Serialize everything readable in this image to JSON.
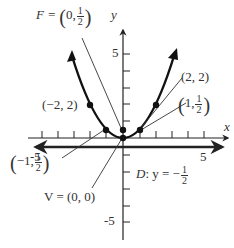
{
  "figure": {
    "axes": {
      "x_label": "x",
      "y_label": "y",
      "x_tick_labels": [
        "-5",
        "5"
      ],
      "y_tick_labels": [
        "5",
        "-5"
      ],
      "x_range": [
        -6,
        6
      ],
      "y_range": [
        -6,
        6
      ]
    },
    "labels": {
      "focus": {
        "prefix": "F = ",
        "open": "(",
        "x": "0,",
        "num": "1",
        "den": "2",
        "close": ")"
      },
      "vertex": "V = (0, 0)",
      "directrix": {
        "prefix": "D",
        "mid": ": y = −",
        "num": "1",
        "den": "2"
      },
      "point_neg2": "(−2, 2)",
      "point_2": "(2, 2)",
      "point_1": {
        "open": "(",
        "x": "1,",
        "num": "1",
        "den": "2",
        "close": ")"
      },
      "point_neg1": {
        "open": "(",
        "x": "−1,",
        "num": "1",
        "den": "2",
        "close": ")"
      }
    },
    "points": [
      {
        "name": "vertex",
        "x": 0,
        "y": 0
      },
      {
        "name": "focus",
        "x": 0,
        "y": 0.5
      },
      {
        "name": "p1",
        "x": 1,
        "y": 0.5
      },
      {
        "name": "pm1",
        "x": -1,
        "y": 0.5
      },
      {
        "name": "p2",
        "x": 2,
        "y": 2
      },
      {
        "name": "pm2",
        "x": -2,
        "y": 2
      }
    ],
    "equation": "x^2 = 2y",
    "colors": {
      "ink": "#222222",
      "label": "#333333",
      "background": "#ffffff"
    }
  }
}
